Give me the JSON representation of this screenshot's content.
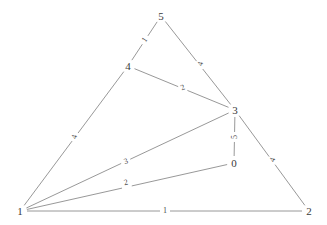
{
  "diagram": {
    "type": "node-link-graph",
    "background_color": "#ffffff",
    "edge_color": "#8c8c8c",
    "node_label_color": "#3a3a3a",
    "edge_label_color": "#4a4a4a",
    "width": 327,
    "height": 225
  },
  "nodes": [
    {
      "id": "0",
      "label": "0",
      "x": 234,
      "y": 163
    },
    {
      "id": "1",
      "label": "1",
      "x": 20,
      "y": 211
    },
    {
      "id": "2",
      "label": "2",
      "x": 309,
      "y": 211
    },
    {
      "id": "3",
      "label": "3",
      "x": 235,
      "y": 110
    },
    {
      "id": "4",
      "label": "4",
      "x": 128,
      "y": 66
    },
    {
      "id": "5",
      "label": "5",
      "x": 161,
      "y": 16
    }
  ],
  "edges": [
    {
      "source": "5",
      "target": "4",
      "label": "1",
      "lx": 145,
      "ly": 40,
      "rot": 57
    },
    {
      "source": "5",
      "target": "3",
      "label": "4",
      "lx": 201,
      "ly": 64,
      "rot": 72
    },
    {
      "source": "4",
      "target": "3",
      "label": "2",
      "lx": 183,
      "ly": 88,
      "rot": 22
    },
    {
      "source": "1",
      "target": "4",
      "label": "4",
      "lx": 75,
      "ly": 137,
      "rot": 72
    },
    {
      "source": "3",
      "target": "0",
      "label": "5",
      "lx": 235,
      "ly": 137,
      "rot": 90
    },
    {
      "source": "1",
      "target": "3",
      "label": "3",
      "lx": 126,
      "ly": 162,
      "rot": 18
    },
    {
      "source": "1",
      "target": "0",
      "label": "2",
      "lx": 126,
      "ly": 183,
      "rot": 13
    },
    {
      "source": "3",
      "target": "2",
      "label": "4",
      "lx": 273,
      "ly": 160,
      "rot": 69
    },
    {
      "source": "1",
      "target": "2",
      "label": "1",
      "lx": 165,
      "ly": 211,
      "rot": 0
    }
  ]
}
